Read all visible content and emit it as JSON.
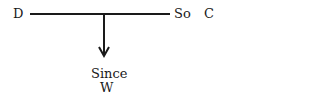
{
  "diagram": {
    "type": "toulmin-argument",
    "data_label": "D",
    "so_label": "So",
    "claim_label": "C",
    "since_label": "Since",
    "warrant_label": "W"
  },
  "colors": {
    "line": "#1a1a1a",
    "text": "#1a1a1a",
    "background": "#ffffff"
  }
}
